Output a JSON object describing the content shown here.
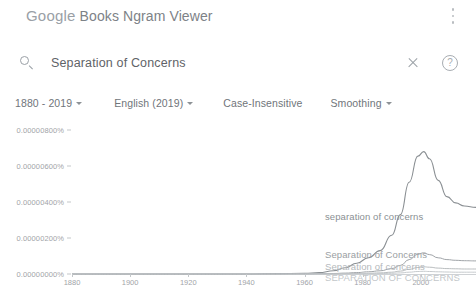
{
  "header": {
    "brand_google": "Google",
    "brand_rest": "Books Ngram Viewer",
    "menu_icon": "kebab-menu-icon"
  },
  "search": {
    "value": "Separation of Concerns",
    "placeholder": "Search",
    "search_icon": "search-icon",
    "clear_icon": "close-icon",
    "help_icon": "help-icon",
    "help_glyph": "?"
  },
  "filters": [
    {
      "label": "1880 - 2019",
      "has_caret": true
    },
    {
      "label": "English (2019)",
      "has_caret": true
    },
    {
      "label": "Case-Insensitive",
      "has_caret": false
    },
    {
      "label": "Smoothing",
      "has_caret": true
    }
  ],
  "colors": {
    "series_1": "#8a8f93",
    "series_2": "#9a9ea2",
    "series_3": "#b4b8bb",
    "series_4": "#c3c7ca",
    "axis": "#c3c7ca",
    "text": "#9fa4a8"
  },
  "chart_data": {
    "type": "line",
    "title": "",
    "xlabel": "",
    "ylabel": "",
    "xlim": [
      1880,
      2019
    ],
    "ylim": [
      0,
      8e-05
    ],
    "grid": false,
    "legend_position": "inline-right",
    "xticks": [
      1880,
      1900,
      1920,
      1940,
      1960,
      1980,
      2000
    ],
    "yticks": [
      8e-05,
      6e-05,
      4e-05,
      2e-05,
      0
    ],
    "ytick_labels": [
      "0.00000800%",
      "0.00000600%",
      "0.00000400%",
      "0.00000200%",
      "0.00000000%"
    ],
    "x": [
      1880,
      1900,
      1920,
      1940,
      1950,
      1960,
      1965,
      1970,
      1974,
      1978,
      1982,
      1986,
      1990,
      1993,
      1996,
      1999,
      2001,
      2003,
      2006,
      2009,
      2012,
      2015,
      2019
    ],
    "series": [
      {
        "name": "separation of concerns",
        "color": "#8a8f93",
        "values": [
          0,
          0,
          0,
          0,
          2e-07,
          4e-07,
          8e-07,
          1.8e-06,
          3.5e-06,
          6e-06,
          9e-06,
          1.3e-05,
          2.15e-05,
          3.3e-05,
          5.1e-05,
          6.55e-05,
          6.8e-05,
          6.4e-05,
          5.2e-05,
          4.3e-05,
          3.95e-05,
          3.78e-05,
          3.7e-05
        ]
      },
      {
        "name": "Separation of Concerns",
        "color": "#9a9ea2",
        "values": [
          0,
          0,
          0,
          0,
          0,
          1e-07,
          2e-07,
          3e-07,
          5e-07,
          8e-07,
          1.2e-06,
          1.8e-06,
          3e-06,
          4.8e-06,
          8e-06,
          1.1e-05,
          1.18e-05,
          1.08e-05,
          9e-06,
          8e-06,
          7.6e-06,
          7.4e-06,
          7.3e-06
        ]
      },
      {
        "name": "Separation of concerns",
        "color": "#b4b8bb",
        "values": [
          0,
          0,
          0,
          0,
          0,
          0,
          1e-07,
          1e-07,
          2e-07,
          3e-07,
          4e-07,
          6e-07,
          1e-06,
          1.6e-06,
          2.6e-06,
          3.6e-06,
          4e-06,
          3.8e-06,
          3.3e-06,
          3e-06,
          2.9e-06,
          2.8e-06,
          2.8e-06
        ]
      },
      {
        "name": "SEPARATION OF CONCERNS",
        "color": "#c3c7ca",
        "values": [
          0,
          0,
          0,
          0,
          0,
          0,
          0,
          0,
          1e-07,
          1e-07,
          2e-07,
          2e-07,
          4e-07,
          6e-07,
          1e-06,
          1.4e-06,
          1.5e-06,
          1.4e-06,
          1.2e-06,
          1.1e-06,
          1e-06,
          1e-06,
          1e-06
        ]
      }
    ]
  }
}
